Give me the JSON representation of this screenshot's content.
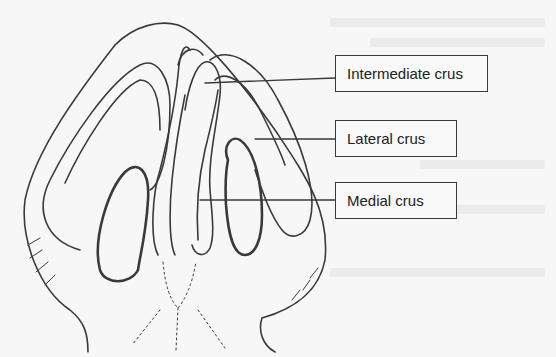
{
  "figure": {
    "labels": [
      {
        "id": "intermediate",
        "text": "Intermediate crus"
      },
      {
        "id": "lateral",
        "text": "Lateral crus"
      },
      {
        "id": "medial",
        "text": "Medial crus"
      }
    ]
  },
  "colors": {
    "background": "#f7f7f7",
    "ink": "#3a3a3a",
    "box_border": "#3a3a3a"
  }
}
